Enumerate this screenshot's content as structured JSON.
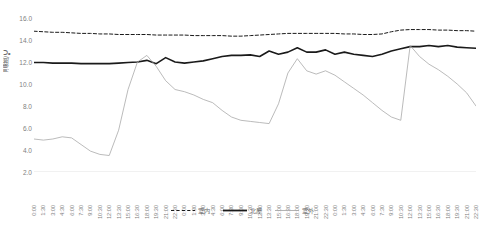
{
  "chart_data": {
    "type": "line",
    "title": "",
    "xlabel": "",
    "ylabel": "温度/℃",
    "ylim": [
      2.0,
      16.0
    ],
    "ytick_labels": [
      "16.0",
      "14.0",
      "12.0",
      "10.0",
      "8.0",
      "6.0",
      "4.0",
      "2.0"
    ],
    "ytick_values": [
      16.0,
      14.0,
      12.0,
      10.0,
      8.0,
      6.0,
      4.0,
      2.0
    ],
    "grid": false,
    "legend_position": "bottom-center",
    "x_tick_interval_minutes": 90,
    "x_span_days": 3,
    "categories": [
      "0:00",
      "1:30",
      "3:00",
      "4:30",
      "6:00",
      "7:30",
      "9:00",
      "10:30",
      "12:00",
      "13:30",
      "15:00",
      "16:30",
      "18:00",
      "19:30",
      "21:00",
      "22:30",
      "0:00",
      "1:30",
      "3:00",
      "4:30",
      "6:00",
      "7:30",
      "9:00",
      "10:30",
      "12:00",
      "13:30",
      "15:00",
      "16:30",
      "18:00",
      "19:30",
      "21:00",
      "22:30",
      "0:00",
      "1:30",
      "3:00",
      "4:30",
      "6:00",
      "7:30",
      "9:00",
      "10:30",
      "12:00",
      "13:30",
      "15:00",
      "16:30",
      "18:00",
      "19:30",
      "21:00",
      "22:30"
    ],
    "series": [
      {
        "name": "室内",
        "style": "dashed",
        "color": "#1a1a1a",
        "width": 1.0,
        "values": [
          14.8,
          14.75,
          14.7,
          14.7,
          14.65,
          14.6,
          14.6,
          14.55,
          14.55,
          14.5,
          14.5,
          14.5,
          14.5,
          14.45,
          14.45,
          14.45,
          14.45,
          14.4,
          14.4,
          14.4,
          14.4,
          14.35,
          14.35,
          14.4,
          14.45,
          14.5,
          14.55,
          14.6,
          14.6,
          14.6,
          14.6,
          14.6,
          14.6,
          14.55,
          14.55,
          14.5,
          14.5,
          14.55,
          14.75,
          14.9,
          14.95,
          14.95,
          14.95,
          14.9,
          14.9,
          14.85,
          14.85,
          14.8
        ]
      },
      {
        "name": "北屋",
        "style": "solid-thick",
        "color": "#1a1a1a",
        "width": 1.6,
        "values": [
          11.95,
          11.95,
          11.9,
          11.9,
          11.9,
          11.85,
          11.85,
          11.85,
          11.85,
          11.9,
          11.95,
          12.0,
          12.15,
          11.85,
          12.4,
          12.0,
          11.9,
          12.0,
          12.1,
          12.3,
          12.5,
          12.6,
          12.6,
          12.65,
          12.5,
          13.0,
          12.7,
          12.9,
          13.3,
          12.9,
          12.9,
          13.1,
          12.7,
          12.9,
          12.7,
          12.6,
          12.5,
          12.7,
          13.0,
          13.2,
          13.4,
          13.4,
          13.5,
          13.4,
          13.5,
          13.35,
          13.3,
          13.25
        ]
      },
      {
        "name": "室外",
        "style": "solid-thin",
        "color": "#aaaaaa",
        "width": 0.8,
        "values": [
          5.0,
          4.9,
          5.0,
          5.2,
          5.1,
          4.5,
          3.9,
          3.6,
          3.5,
          5.8,
          9.5,
          12.0,
          12.6,
          11.6,
          10.3,
          9.5,
          9.3,
          9.0,
          8.6,
          8.3,
          7.6,
          7.0,
          6.7,
          6.6,
          6.5,
          6.4,
          8.2,
          11.0,
          12.3,
          11.2,
          10.9,
          11.2,
          10.8,
          10.2,
          9.6,
          9.0,
          8.3,
          7.6,
          7.0,
          6.7,
          13.5,
          12.5,
          11.8,
          11.3,
          10.7,
          10.0,
          9.2,
          8.0
        ]
      }
    ]
  },
  "legend": {
    "items": [
      {
        "label": "室内",
        "style": "dashed"
      },
      {
        "label": "北屋",
        "style": "solid-thick"
      },
      {
        "label": "室外",
        "style": "solid-thin"
      }
    ]
  },
  "axis": {
    "y_title": "温度/℃"
  }
}
